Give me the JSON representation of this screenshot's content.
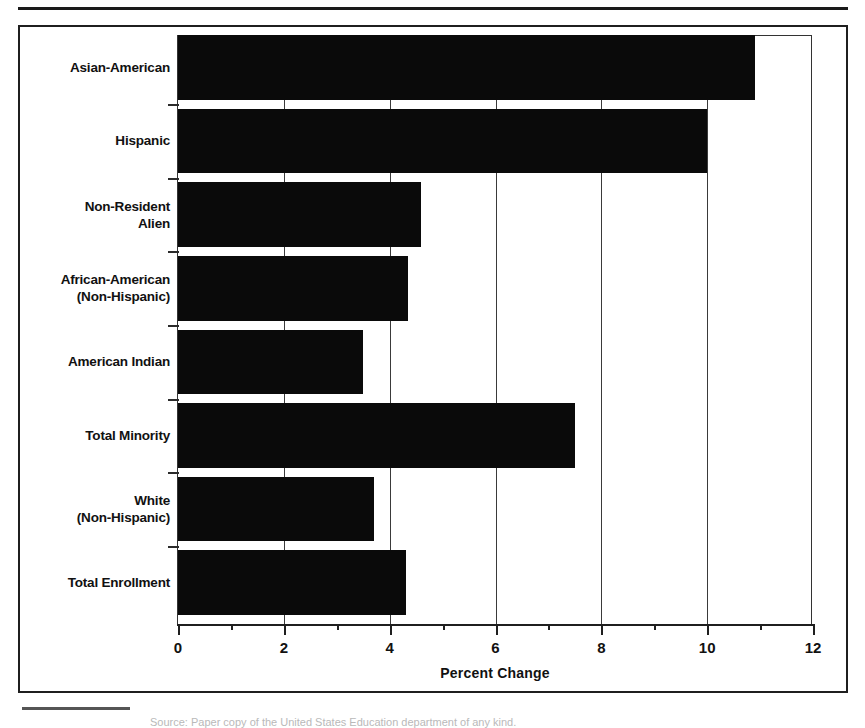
{
  "figure": {
    "axis_title": "Percent Change",
    "footnote": "Source: Paper copy of the United States Education department of any kind."
  },
  "chart_data": {
    "type": "bar",
    "orientation": "horizontal",
    "title": "",
    "xlabel": "Percent Change",
    "ylabel": "",
    "xlim": [
      0,
      12
    ],
    "grid": true,
    "legend": null,
    "bar_color": "#0a0a0a",
    "categories": [
      "Asian-American",
      "Hispanic",
      "Non-Resident\nAlien",
      "African-American\n(Non-Hispanic)",
      "American Indian",
      "Total Minority",
      "White\n(Non-Hispanic)",
      "Total Enrollment"
    ],
    "category_lines": [
      [
        "Asian-American"
      ],
      [
        "Hispanic"
      ],
      [
        "Non-Resident",
        "Alien"
      ],
      [
        "African-American",
        "(Non-Hispanic)"
      ],
      [
        "American Indian"
      ],
      [
        "Total Minority"
      ],
      [
        "White",
        "(Non-Hispanic)"
      ],
      [
        "Total Enrollment"
      ]
    ],
    "values": [
      10.9,
      10.0,
      4.6,
      4.35,
      3.5,
      7.5,
      3.7,
      4.3
    ],
    "xticks_major": [
      0,
      2,
      4,
      6,
      8,
      10,
      12
    ],
    "xticks_major_labels": [
      "0",
      "2",
      "4",
      "6",
      "8",
      "10",
      "12"
    ],
    "xticks_minor": [
      1,
      3,
      5,
      7,
      9,
      11
    ],
    "gridlines": [
      2,
      4,
      6,
      8,
      10
    ]
  }
}
